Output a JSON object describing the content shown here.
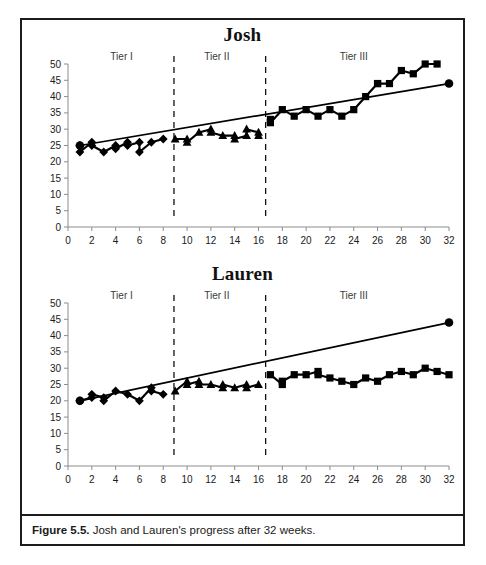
{
  "figure": {
    "caption_label": "Figure 5.5.",
    "caption_text": " Josh and Lauren's progress after 32 weeks.",
    "frame_color": "#1c1c1c"
  },
  "charts": [
    {
      "id": "josh",
      "title": "Josh"
    },
    {
      "id": "lauren",
      "title": "Lauren"
    }
  ],
  "chart_data": [
    {
      "type": "line",
      "title": "Josh",
      "xlabel": "",
      "ylabel": "",
      "xlim": [
        0,
        32
      ],
      "ylim": [
        0,
        50
      ],
      "xticks": [
        0,
        2,
        4,
        6,
        8,
        10,
        12,
        14,
        16,
        18,
        20,
        22,
        24,
        26,
        28,
        30,
        32
      ],
      "yticks": [
        0,
        5,
        10,
        15,
        20,
        25,
        30,
        35,
        40,
        45,
        50
      ],
      "grid": false,
      "legend": "none",
      "annotations": [
        {
          "text": "Tier I",
          "x": 4.5,
          "y": 50
        },
        {
          "text": "Tier II",
          "x": 12.5,
          "y": 50
        },
        {
          "text": "Tier III",
          "x": 24.0,
          "y": 50
        }
      ],
      "phase_lines": [
        8.9,
        16.6
      ],
      "series": [
        {
          "name": "Tier I (diamond)",
          "marker": "diamond",
          "x": [
            1,
            1,
            2,
            2,
            3,
            4,
            4,
            5,
            5,
            6,
            6,
            7,
            8
          ],
          "values": [
            25,
            23,
            26,
            25,
            23,
            25,
            24,
            26,
            25,
            26,
            23,
            26,
            27
          ]
        },
        {
          "name": "Tier II (triangle)",
          "marker": "triangle",
          "x": [
            9,
            10,
            10,
            11,
            12,
            12,
            13,
            14,
            14,
            15,
            15,
            16,
            16
          ],
          "values": [
            27,
            27,
            26,
            29,
            30,
            29,
            28,
            28,
            27,
            28,
            30,
            29,
            28
          ]
        },
        {
          "name": "Tier III (square)",
          "marker": "square",
          "x": [
            17,
            17,
            18,
            19,
            20,
            21,
            22,
            23,
            24,
            25,
            26,
            26,
            27,
            28,
            29,
            30,
            31
          ],
          "values": [
            33,
            32,
            36,
            34,
            36,
            34,
            36,
            34,
            36,
            40,
            44,
            44,
            44,
            48,
            47,
            50,
            50
          ]
        },
        {
          "name": "Goal line",
          "marker": "circle",
          "x": [
            1,
            32
          ],
          "values": [
            25,
            44
          ]
        }
      ]
    },
    {
      "type": "line",
      "title": "Lauren",
      "xlabel": "",
      "ylabel": "",
      "xlim": [
        0,
        32
      ],
      "ylim": [
        0,
        50
      ],
      "xticks": [
        0,
        2,
        4,
        6,
        8,
        10,
        12,
        14,
        16,
        18,
        20,
        22,
        24,
        26,
        28,
        30,
        32
      ],
      "yticks": [
        0,
        5,
        10,
        15,
        20,
        25,
        30,
        35,
        40,
        45,
        50
      ],
      "grid": false,
      "legend": "none",
      "annotations": [
        {
          "text": "Tier I",
          "x": 4.5,
          "y": 50
        },
        {
          "text": "Tier II",
          "x": 12.5,
          "y": 50
        },
        {
          "text": "Tier III",
          "x": 24.0,
          "y": 50
        }
      ],
      "phase_lines": [
        8.9,
        16.6
      ],
      "series": [
        {
          "name": "Tier I (diamond)",
          "marker": "diamond",
          "x": [
            1,
            2,
            2,
            3,
            3,
            4,
            5,
            6,
            7,
            7,
            8
          ],
          "values": [
            20,
            21,
            22,
            21,
            20,
            23,
            22,
            20,
            24,
            23,
            22
          ]
        },
        {
          "name": "Tier II (triangle)",
          "marker": "triangle",
          "x": [
            9,
            10,
            10,
            11,
            11,
            12,
            13,
            13,
            14,
            15,
            15,
            16
          ],
          "values": [
            23,
            26,
            25,
            26,
            25,
            25,
            24,
            25,
            24,
            25,
            24,
            25
          ]
        },
        {
          "name": "Tier III (square)",
          "marker": "square",
          "x": [
            17,
            18,
            18,
            19,
            20,
            21,
            21,
            22,
            23,
            24,
            25,
            26,
            27,
            28,
            29,
            30,
            31,
            32
          ],
          "values": [
            28,
            25,
            26,
            28,
            28,
            29,
            28,
            27,
            26,
            25,
            27,
            26,
            28,
            29,
            28,
            30,
            29,
            28
          ]
        },
        {
          "name": "Goal line",
          "marker": "circle",
          "x": [
            1,
            32
          ],
          "values": [
            20,
            44
          ]
        }
      ]
    }
  ]
}
